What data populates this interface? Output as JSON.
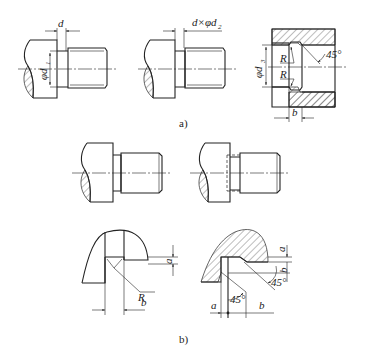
{
  "figure": {
    "part_a": {
      "caption": "a)",
      "views": [
        {
          "name": "undercut-dim-d",
          "labels": {
            "width": "d",
            "diameter": "φd",
            "diameter_sub": "1"
          }
        },
        {
          "name": "undercut-dim-d-x-phi-d2",
          "labels": {
            "callout": "d×φd",
            "callout_sub": "2"
          }
        },
        {
          "name": "internal-undercut-section",
          "labels": {
            "diameter": "φd",
            "diameter_sub": "3",
            "radius_top": "R",
            "radius_bottom": "R",
            "angle": "45°",
            "width": "b"
          }
        }
      ]
    },
    "part_b": {
      "caption": "b)",
      "views": [
        {
          "name": "shaft-with-relief-groove"
        },
        {
          "name": "shaft-with-hidden-groove"
        },
        {
          "name": "detail-radius-groove",
          "labels": {
            "depth": "a",
            "radius": "R",
            "width": "b"
          }
        },
        {
          "name": "detail-chamfer-groove",
          "labels": {
            "depth": "a",
            "width_vertical": "b",
            "angle_right": "45°",
            "angle_bottom": "45°",
            "offset": "a",
            "width": "b"
          }
        }
      ]
    }
  }
}
